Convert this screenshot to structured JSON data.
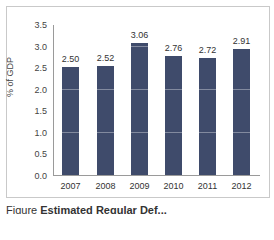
{
  "chart_data": {
    "type": "bar",
    "title": "",
    "xlabel": "",
    "ylabel": "% of GDP",
    "ylim": [
      0,
      3.5
    ],
    "yticks": [
      "0.0",
      "0.5",
      "1.0",
      "1.5",
      "2.0",
      "2.5",
      "3.0",
      "3.5"
    ],
    "categories": [
      "2007",
      "2008",
      "2009",
      "2010",
      "2011",
      "2012"
    ],
    "values": [
      2.5,
      2.52,
      3.06,
      2.76,
      2.72,
      2.91
    ],
    "value_labels": [
      "2.50",
      "2.52",
      "3.06",
      "2.76",
      "2.72",
      "2.91"
    ],
    "grid": true,
    "legend": null,
    "bar_color": "#3f4b6b"
  },
  "caption": {
    "prefix": "Figure ",
    "title": "Estimated Regular Def..."
  }
}
